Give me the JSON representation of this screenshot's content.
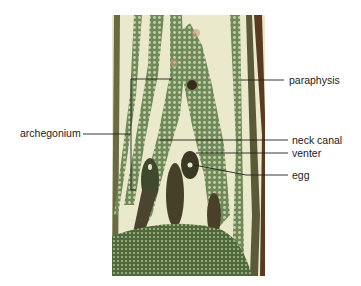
{
  "figure": {
    "labels": {
      "archegonium": "archegonium",
      "paraphysis": "paraphysis",
      "neck_canal": "neck canal",
      "venter": "venter",
      "egg": "egg"
    },
    "colors": {
      "background": "#ffffff",
      "tissue_light": "#e9e8c8",
      "tissue_green": "#6f8a5a",
      "tissue_dark": "#3f4a2c",
      "stain_brown": "#5a3b22",
      "leader_line": "#222222"
    }
  }
}
